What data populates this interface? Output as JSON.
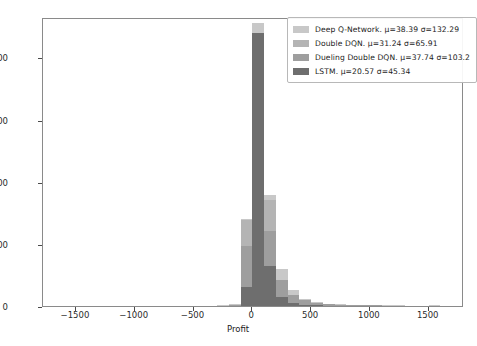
{
  "chart_data": {
    "type": "bar",
    "subtype": "overlapping-histogram",
    "title": "",
    "xlabel": "Profit",
    "ylabel": "",
    "xlim": [
      -1780,
      1800
    ],
    "ylim": [
      0,
      465
    ],
    "xticks": [
      -1500,
      -1000,
      -500,
      0,
      500,
      1000,
      1500
    ],
    "yticks": [
      0,
      100,
      200,
      300,
      400
    ],
    "grid": false,
    "legend_position": "upper right",
    "bin_width": 100,
    "bin_edges": [
      -1800,
      -1700,
      -1600,
      -1500,
      -1400,
      -1300,
      -1200,
      -1100,
      -1000,
      -900,
      -800,
      -700,
      -600,
      -500,
      -400,
      -300,
      -200,
      -100,
      0,
      100,
      200,
      300,
      400,
      500,
      600,
      700,
      800,
      900,
      1000,
      1100,
      1200,
      1300,
      1400,
      1500,
      1600,
      1700,
      1800
    ],
    "series": [
      {
        "name": "Deep Q-Network",
        "label": "Deep Q-Network. μ=38.39 σ=132.29",
        "mu": 38.39,
        "sigma": 132.29,
        "color": "#c8c8c8",
        "values": [
          0,
          0,
          0,
          0,
          0,
          0,
          0,
          0,
          0,
          0,
          0,
          0,
          0,
          0,
          0,
          1,
          3,
          140,
          455,
          178,
          60,
          26,
          12,
          6,
          4,
          3,
          2,
          2,
          1,
          1,
          1,
          0,
          0,
          1,
          0,
          0
        ]
      },
      {
        "name": "Double DQN",
        "label": "Double DQN. μ=31.24 σ=65.91",
        "mu": 31.24,
        "sigma": 65.91,
        "color": "#b4b4b4",
        "values": [
          0,
          0,
          0,
          0,
          0,
          0,
          0,
          0,
          0,
          0,
          0,
          0,
          0,
          0,
          0,
          0,
          1,
          139,
          440,
          170,
          33,
          11,
          5,
          3,
          1,
          1,
          0,
          0,
          0,
          0,
          0,
          0,
          0,
          0,
          0,
          0
        ]
      },
      {
        "name": "Dueling Double DQN",
        "label": "Dueling Double DQN. μ=37.74 σ=103.2",
        "mu": 37.74,
        "sigma": 103.2,
        "color": "#9e9e9e",
        "values": [
          0,
          0,
          0,
          0,
          0,
          0,
          0,
          0,
          0,
          0,
          0,
          0,
          0,
          0,
          0,
          0,
          2,
          96,
          325,
          120,
          42,
          18,
          9,
          5,
          3,
          2,
          1,
          1,
          1,
          0,
          0,
          0,
          0,
          0,
          0,
          0
        ]
      },
      {
        "name": "LSTM",
        "label": "LSTM. μ=20.57 σ=45.34",
        "mu": 20.57,
        "sigma": 45.34,
        "color": "#6e6e6e",
        "values": [
          0,
          0,
          0,
          0,
          0,
          0,
          0,
          0,
          0,
          0,
          0,
          0,
          0,
          0,
          0,
          0,
          0,
          30,
          440,
          65,
          14,
          5,
          2,
          1,
          0,
          0,
          0,
          0,
          0,
          0,
          0,
          0,
          0,
          0,
          0,
          0
        ]
      }
    ]
  },
  "legend": {
    "entries": [
      {
        "swatch": "legend-swatch-deep-q-network",
        "label": "Deep Q-Network. μ=38.39 σ=132.29"
      },
      {
        "swatch": "legend-swatch-double-dqn",
        "label": "Double DQN. μ=31.24 σ=65.91"
      },
      {
        "swatch": "legend-swatch-dueling-double-dqn",
        "label": "Dueling Double DQN. μ=37.74 σ=103.2"
      },
      {
        "swatch": "legend-swatch-lstm",
        "label": "LSTM. μ=20.57 σ=45.34"
      }
    ]
  }
}
